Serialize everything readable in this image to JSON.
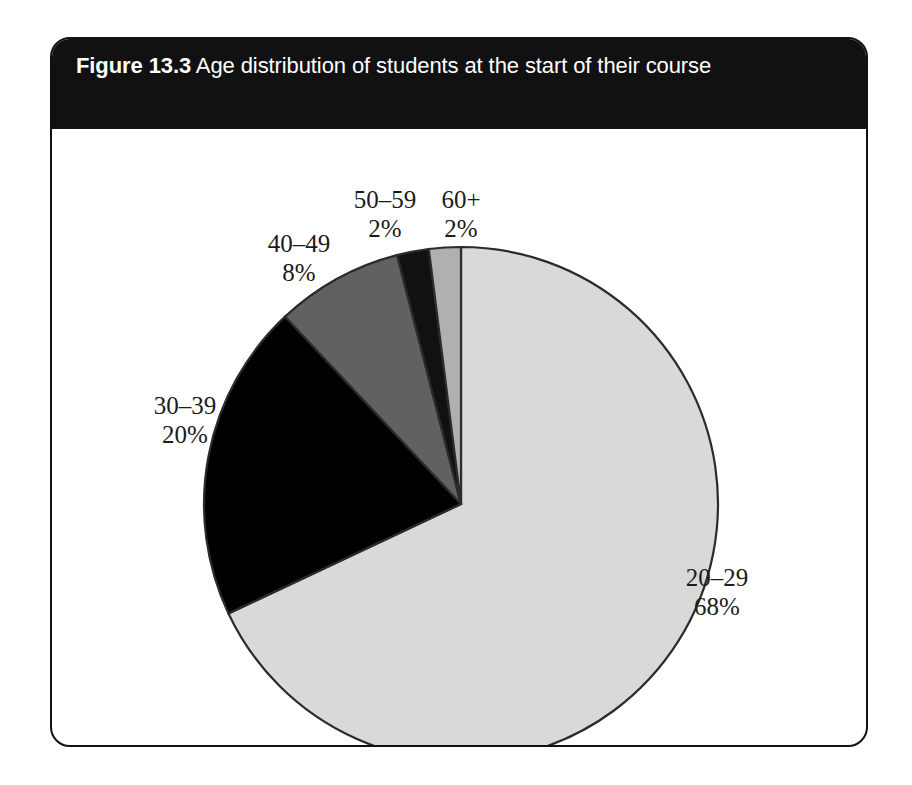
{
  "figure": {
    "number_label": "Figure 13.3",
    "caption": " Age distribution of students at the start of their course"
  },
  "chart_data": {
    "type": "pie",
    "title": "Figure 13.3 Age distribution of students at the start of their course",
    "xlabel": "",
    "ylabel": "",
    "legend_position": "none",
    "grid": false,
    "start_angle_deg": 0,
    "direction": "clockwise",
    "categories": [
      "20–29",
      "30–39",
      "40–49",
      "50–59",
      "60+"
    ],
    "values": [
      68,
      20,
      8,
      2,
      2
    ],
    "unit": "%",
    "slices": [
      {
        "label": "20–29",
        "percent": 68,
        "percent_text": "68%",
        "color": "#d9d9d9"
      },
      {
        "label": "30–39",
        "percent": 20,
        "percent_text": "20%",
        "color": "#000000"
      },
      {
        "label": "40–49",
        "percent": 8,
        "percent_text": "8%",
        "color": "#616161"
      },
      {
        "label": "50–59",
        "percent": 2,
        "percent_text": "2%",
        "color": "#111111"
      },
      {
        "label": "60+",
        "percent": 2,
        "percent_text": "2%",
        "color": "#b0b0b0"
      }
    ],
    "colors": {
      "outline": "#2b2b2b",
      "banner_background": "#111111",
      "banner_text": "#ffffff",
      "frame_border": "#111111",
      "label_text": "#1b1b1b",
      "page_background": "#ffffff"
    }
  }
}
